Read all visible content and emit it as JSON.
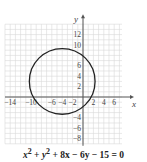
{
  "chart_data": {
    "type": "line",
    "title": "",
    "xlabel": "x",
    "ylabel": "y",
    "xlim": [
      -15,
      7.5
    ],
    "ylim": [
      -9,
      14
    ],
    "grid": true,
    "x_tick_labels": [
      "-14",
      "-10",
      "-6",
      "-4",
      "-2",
      "2",
      "4",
      "6"
    ],
    "y_tick_labels": [
      "12",
      "10",
      "6",
      "4",
      "2",
      "-4",
      "-6",
      "-8"
    ],
    "series": [
      {
        "name": "circle",
        "shape": "circle",
        "center": [
          -4,
          3
        ],
        "radius": 6.32
      }
    ],
    "caption": "x^2 + y^2 + 8x - 6y - 15 = 0"
  },
  "axis_labels": {
    "x": "x",
    "y": "y"
  },
  "caption": {
    "x2": "x",
    "y2": "y",
    "rest": " + 8x − 6y − 15 = 0",
    "plus": " + ",
    "sup": "2"
  }
}
